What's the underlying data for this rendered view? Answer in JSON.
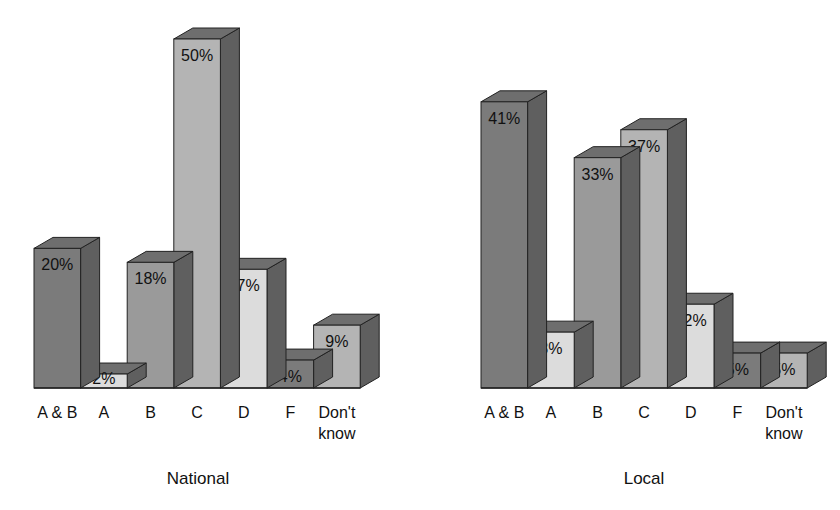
{
  "chart_data": [
    {
      "type": "bar",
      "style": "3d",
      "title": "National",
      "xlabel": "",
      "ylabel": "",
      "categories": [
        "A & B",
        "A",
        "B",
        "C",
        "D",
        "F",
        "Don't know"
      ],
      "values": [
        20,
        2,
        18,
        50,
        17,
        4,
        9
      ],
      "value_labels": [
        "20%",
        "2%",
        "18%",
        "50%",
        "17%",
        "4%",
        "9%"
      ],
      "ylim": [
        0,
        50
      ],
      "grid": false,
      "legend": "none"
    },
    {
      "type": "bar",
      "style": "3d",
      "title": "Local",
      "xlabel": "",
      "ylabel": "",
      "categories": [
        "A & B",
        "A",
        "B",
        "C",
        "D",
        "F",
        "Don't know"
      ],
      "values": [
        41,
        8,
        33,
        37,
        12,
        5,
        5
      ],
      "value_labels": [
        "41%",
        "8%",
        "33%",
        "37%",
        "12%",
        "5%",
        "5%"
      ],
      "ylim": [
        0,
        50
      ],
      "grid": false,
      "legend": "none"
    }
  ],
  "colors": {
    "dark_face": "#7b7b7b",
    "mid_face": "#9a9a9a",
    "light_face": "#b4b4b4",
    "pale_face": "#dcdcdc",
    "side": "#5f5f5f",
    "top": "#6e6e6e",
    "outline": "#222222"
  },
  "bar_shades": [
    "dark_face",
    "pale_face",
    "mid_face",
    "light_face",
    "pale_face",
    "dark_face",
    "light_face"
  ]
}
